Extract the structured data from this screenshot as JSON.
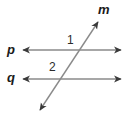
{
  "figure": {
    "kind": "geometry-diagram",
    "background_color": "#ffffff",
    "line_color": "#8a8a8a",
    "label_color": "#1a1a1a",
    "width": 128,
    "height": 120
  },
  "labels": {
    "line_p": "p",
    "line_q": "q",
    "line_m": "m",
    "angle_1": "1",
    "angle_2": "2"
  },
  "geometry": {
    "line_p": {
      "name": "p",
      "type": "double-arrow-line",
      "orientation": "horizontal",
      "x1": 22,
      "y1": 50,
      "x2": 122,
      "y2": 50
    },
    "line_q": {
      "name": "q",
      "type": "double-arrow-line",
      "orientation": "horizontal",
      "x1": 22,
      "y1": 79,
      "x2": 122,
      "y2": 79
    },
    "line_m": {
      "name": "m",
      "type": "double-arrow-line",
      "orientation": "transversal",
      "x1": 40,
      "y1": 110,
      "x2": 98,
      "y2": 22
    },
    "intersections": [
      {
        "lines": "m-p",
        "x": 80,
        "y": 50
      },
      {
        "lines": "m-q",
        "x": 62,
        "y": 79
      }
    ]
  }
}
